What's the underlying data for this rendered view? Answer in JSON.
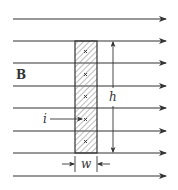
{
  "diagram": {
    "type": "physics-figure",
    "colors": {
      "background": "#ffffff",
      "line": "#333333",
      "hatch": "#777777"
    },
    "field": {
      "label": "B",
      "direction": "right",
      "line_count": 8
    },
    "strip": {
      "hatched": true,
      "segments": 5,
      "segment_symbol": "×",
      "current_label": "i",
      "width_label": "w",
      "height_label": "h"
    }
  }
}
